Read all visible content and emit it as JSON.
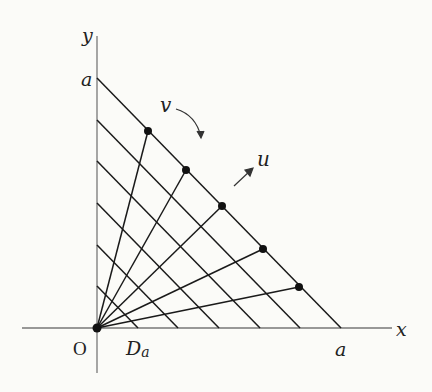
{
  "figure": {
    "axes": {
      "x_label": "x",
      "y_label": "y",
      "origin_label": "O",
      "x_intercept_label": "a",
      "y_intercept_label": "a"
    },
    "region_label": "D",
    "region_subscript": "a",
    "u_label": "u",
    "v_label": "v",
    "parallel_lines": {
      "count": 6,
      "fractions_of_a": [
        0.1667,
        0.3333,
        0.5,
        0.6667,
        0.8333,
        1.0
      ]
    },
    "rays": {
      "count": 5,
      "endpoints_on_hypotenuse_fraction_x": [
        0.21,
        0.37,
        0.51,
        0.68,
        0.83
      ]
    },
    "colors": {
      "line": "#1a1a1a",
      "axis": "#707070",
      "background": "#fbfbf8"
    }
  }
}
